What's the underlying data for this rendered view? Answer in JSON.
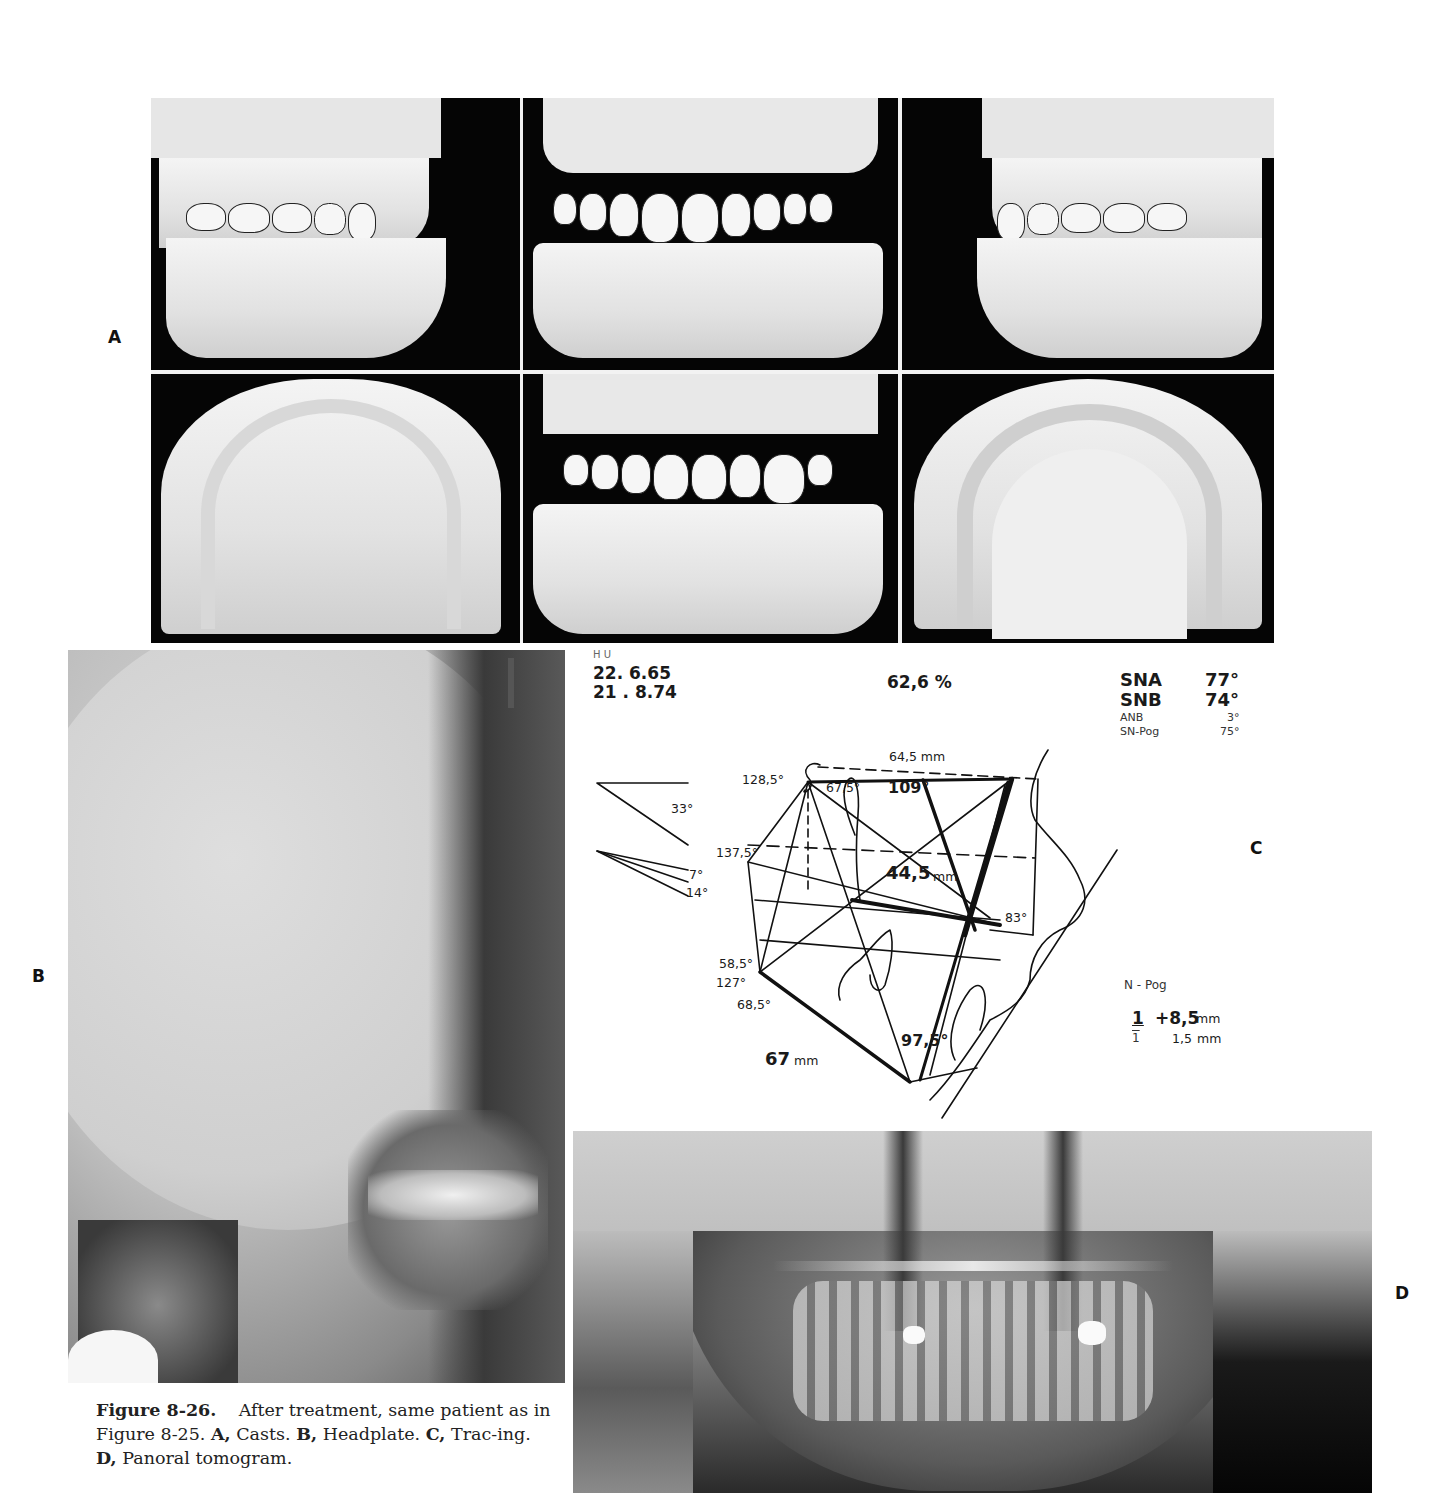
{
  "figure": {
    "panel_labels": {
      "a": "A",
      "b": "B",
      "c": "C",
      "d": "D"
    },
    "caption": {
      "figure_number": "Figure 8-26.",
      "intro": "After treatment, same patient as in Figure 8-25.",
      "parts": [
        {
          "letter": "A,",
          "text": "Casts."
        },
        {
          "letter": "B,",
          "text": "Headplate."
        },
        {
          "letter": "C,",
          "text": "Trac-ing."
        },
        {
          "letter": "D,",
          "text": "Panoral tomogram."
        }
      ]
    }
  },
  "panel_a": {
    "description": "Dental casts",
    "views": [
      {
        "name": "right-lateral-occlusion"
      },
      {
        "name": "frontal-occlusion"
      },
      {
        "name": "left-lateral-occlusion"
      },
      {
        "name": "maxillary-occlusal"
      },
      {
        "name": "frontal-occlusion-alt"
      },
      {
        "name": "mandibular-occlusal"
      }
    ]
  },
  "panel_b": {
    "description": "Lateral cephalometric headplate"
  },
  "panel_c": {
    "header": {
      "initials": "H U",
      "date_1": "22. 6.65",
      "date_2": "21 . 8.74",
      "percent": "62,6 %"
    },
    "measurements": [
      {
        "label": "SNA",
        "value": "77°",
        "emphasis": true
      },
      {
        "label": "SNB",
        "value": "74°",
        "emphasis": true
      },
      {
        "label": "ANB",
        "value": "3°",
        "emphasis": false
      },
      {
        "label": "SN-Pog",
        "value": "75°",
        "emphasis": false
      }
    ],
    "angle_legend": [
      {
        "value": "33°"
      },
      {
        "value": "7°"
      },
      {
        "value": "14°"
      }
    ],
    "annotations": {
      "top_length": "64,5 mm",
      "angle_128": "128,5°",
      "angle_67": "67,5°",
      "angle_109": "109°",
      "angle_137": "137,5°",
      "length_44": "44,5",
      "length_44_unit": "mm",
      "angle_83": "83°",
      "angle_58": "58,5°",
      "angle_127": "127°",
      "angle_68": "68,5°",
      "angle_97": "97,5°",
      "length_67": "67",
      "length_67_unit": "mm"
    },
    "incisor_table": {
      "title": "N - Pog",
      "rows": [
        {
          "tooth": "1",
          "value": "+8,5",
          "unit": "mm",
          "emphasis": true
        },
        {
          "tooth": "1",
          "value": "1,5",
          "unit": "mm",
          "emphasis": false
        }
      ]
    }
  },
  "panel_d": {
    "description": "Panoral tomogram"
  }
}
